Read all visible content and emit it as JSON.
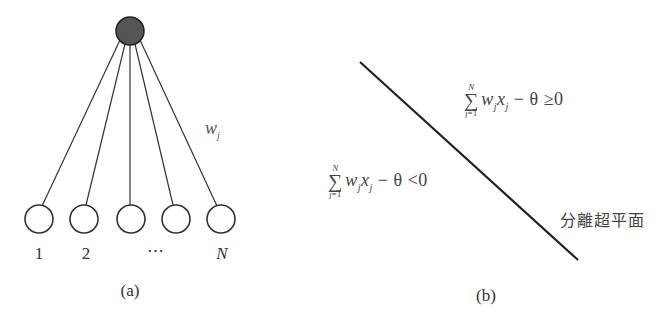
{
  "figure": {
    "panel_a": {
      "caption": "(a)",
      "weight_label": "w",
      "weight_subscript": "j",
      "output_node": {
        "fill": "#555555",
        "stroke": "#222222"
      },
      "input_nodes": [
        {
          "label": "1"
        },
        {
          "label": "2"
        },
        {
          "label": ""
        },
        {
          "label": ""
        },
        {
          "label": "N"
        }
      ],
      "ellipsis": "⋯"
    },
    "panel_b": {
      "caption": "(b)",
      "upper_region": {
        "sum_upper": "N",
        "sum_symbol": "∑",
        "sum_lower": "j=1",
        "w": "w",
        "x": "x",
        "sub": "j",
        "minus_theta": " − θ ",
        "relation": "≥",
        "rhs": "0"
      },
      "lower_region": {
        "sum_upper": "N",
        "sum_symbol": "∑",
        "sum_lower": "j=1",
        "w": "w",
        "x": "x",
        "sub": "j",
        "minus_theta": " − θ ",
        "relation": "<",
        "rhs": "0"
      },
      "hyperplane_label": "分離超平面"
    }
  }
}
